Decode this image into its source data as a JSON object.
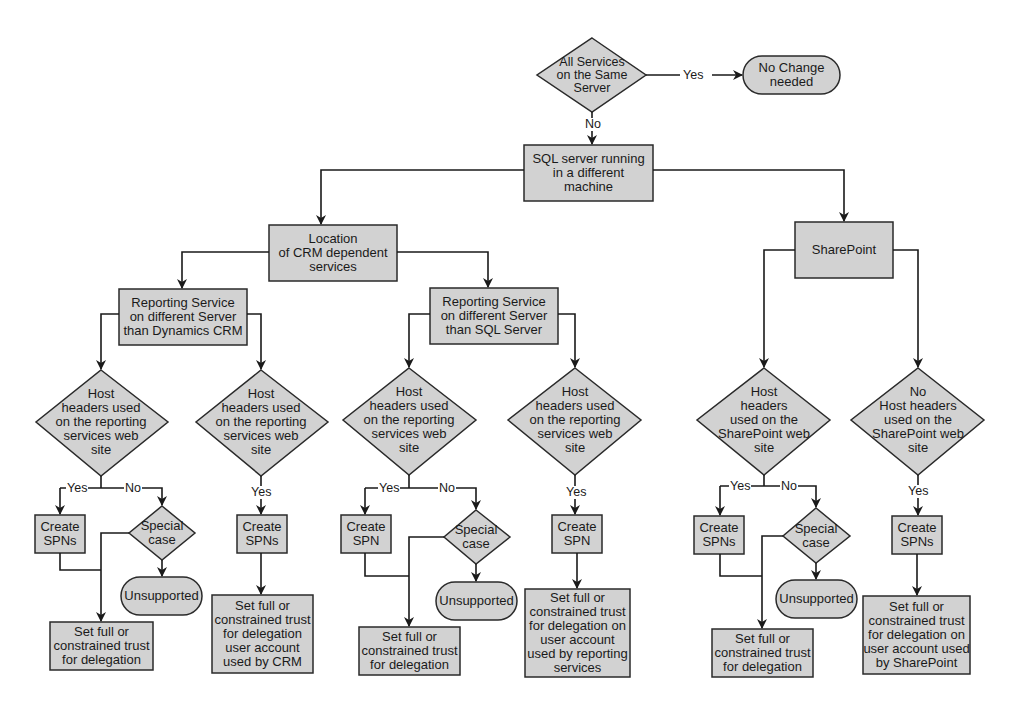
{
  "colors": {
    "fill": "#d2d2d2",
    "stroke": "#2a2a2a",
    "background": "#ffffff"
  },
  "nodes": {
    "all_same_server": "All Services\non the Same\nServer",
    "no_change": "No Change\nneeded",
    "sql_diff_machine": "SQL server running\nin a different\nmachine",
    "crm_location": "Location\nof CRM dependent\nservices",
    "sharepoint": "SharePoint",
    "rs_diff_crm": "Reporting Service\non different Server\nthan Dynamics CRM",
    "rs_diff_sql": "Reporting Service\non different Server\nthan SQL Server",
    "hh1": "Host\nheaders used\non the reporting\nservices web\nsite",
    "hh2": "Host\nheaders used\non the reporting\nservices web\nsite",
    "hh3": "Host\nheaders used\non the reporting\nservices web\nsite",
    "hh4": "Host\nheaders used\non the reporting\nservices web\nsite",
    "hh5": "Host\nheaders\nused on the\nSharePoint web\nsite",
    "hh6": "No\nHost headers\nused on the\nSharePoint web\nsite",
    "spn1": "Create\nSPNs",
    "spn2": "Create\nSPNs",
    "spn3": "Create\nSPN",
    "spn4": "Create\nSPN",
    "spn5": "Create\nSPNs",
    "spn6": "Create\nSPNs",
    "sc1": "Special\ncase",
    "sc3": "Special\ncase",
    "sc5": "Special\ncase",
    "uns1": "Unsupported",
    "uns3": "Unsupported",
    "uns5": "Unsupported",
    "trust1": "Set full or\nconstrained trust\nfor delegation",
    "trust2": "Set full or\nconstrained trust\nfor delegation\nuser account\nused by CRM",
    "trust3": "Set full or\nconstrained trust\nfor delegation",
    "trust4": "Set full or\nconstrained trust\nfor delegation on\nuser account\nused by reporting\nservices",
    "trust5": "Set full or\nconstrained trust\nfor delegation",
    "trust6": "Set full or\nconstrained trust\nfor delegation on\nuser account used\nby SharePoint"
  },
  "labels": {
    "yes_top": "Yes",
    "no_top": "No",
    "y1": "Yes",
    "n1": "No",
    "y2": "Yes",
    "y3": "Yes",
    "n3": "No",
    "y4": "Yes",
    "y5": "Yes",
    "n5": "No",
    "y6": "Yes"
  }
}
